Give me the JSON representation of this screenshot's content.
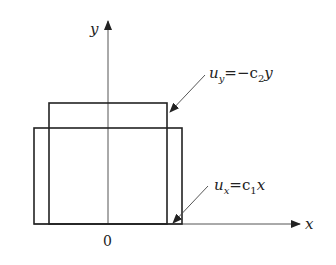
{
  "diagram": {
    "type": "deformation-sketch",
    "axes": {
      "x_label": "x",
      "y_label": "y",
      "origin_label": "0"
    },
    "shapes": [
      {
        "name": "deformed-rectangle-contracted-vertically-widened",
        "description": "wide, shorter rectangle"
      },
      {
        "name": "original-rectangle-narrow-tall",
        "description": "narrower, taller rectangle"
      }
    ],
    "annotations": [
      {
        "id": "uy",
        "base": "u",
        "sub": "y",
        "rhs_prefix": "=−c",
        "rhs_sub": "2",
        "rhs_suffix": "y",
        "text": "u_y = −c_2 y"
      },
      {
        "id": "ux",
        "base": "u",
        "sub": "x",
        "rhs_prefix": "=c",
        "rhs_sub": "1",
        "rhs_suffix": "x",
        "text": "u_x = c_1 x"
      }
    ],
    "colors": {
      "stroke": "#222222",
      "axis": "#555555",
      "background": "#ffffff"
    }
  }
}
